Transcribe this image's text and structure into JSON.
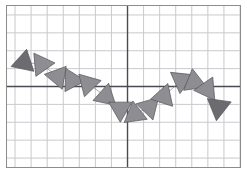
{
  "figure": {
    "title": "",
    "background_color": "#ffffff",
    "frame_border_color": "#8c8c8c",
    "minor_grid_color": "#c9c9cf",
    "major_axis_color": "#4a4a52",
    "marker_fill_light": "#8e8e92",
    "marker_fill_dark": "#6b6b70",
    "marker_stroke": "#5a5a60",
    "connector_color": "#7d7d84"
  },
  "chart_data": {
    "type": "scatter",
    "title": "",
    "xlabel": "",
    "ylabel": "",
    "grid": true,
    "legend": null,
    "xlim": [
      -7.5,
      7.0
    ],
    "ylim": [
      -4.5,
      4.5
    ],
    "x_tick_step": 1,
    "y_tick_step": 1,
    "axis_origin": [
      0,
      0
    ],
    "marker_shape": "triangle",
    "x": [
      -6.45,
      -5.35,
      -4.35,
      -3.45,
      -2.45,
      -1.35,
      -0.45,
      0.45,
      1.35,
      2.25,
      3.35,
      4.15,
      4.95,
      5.65
    ],
    "y": [
      1.35,
      1.25,
      0.55,
      0.35,
      0.15,
      -0.55,
      -1.25,
      -1.55,
      -1.15,
      -0.55,
      0.35,
      0.25,
      -0.15,
      -1.15
    ],
    "rotation_deg": [
      12,
      205,
      160,
      212,
      196,
      252,
      300,
      352,
      44,
      18,
      66,
      112,
      145,
      188
    ],
    "marker_size": [
      30,
      30,
      30,
      30,
      30,
      30,
      30,
      30,
      30,
      30,
      30,
      30,
      30,
      32
    ],
    "shade": [
      "dark",
      "light",
      "light",
      "light",
      "light",
      "light",
      "light",
      "light",
      "light",
      "light",
      "light",
      "light",
      "light",
      "dark"
    ],
    "points": [
      {
        "index": 1,
        "x": -6.45,
        "y": 1.35,
        "rotation_deg": 12,
        "shade": "dark"
      },
      {
        "index": 2,
        "x": -5.35,
        "y": 1.25,
        "rotation_deg": 205,
        "shade": "light"
      },
      {
        "index": 3,
        "x": -4.35,
        "y": 0.55,
        "rotation_deg": 160,
        "shade": "light"
      },
      {
        "index": 4,
        "x": -3.45,
        "y": 0.35,
        "rotation_deg": 212,
        "shade": "light"
      },
      {
        "index": 5,
        "x": -2.45,
        "y": 0.15,
        "rotation_deg": 196,
        "shade": "light"
      },
      {
        "index": 6,
        "x": -1.35,
        "y": -0.55,
        "rotation_deg": 252,
        "shade": "light"
      },
      {
        "index": 7,
        "x": -0.45,
        "y": -1.25,
        "rotation_deg": 300,
        "shade": "light"
      },
      {
        "index": 8,
        "x": 0.45,
        "y": -1.55,
        "rotation_deg": 352,
        "shade": "light"
      },
      {
        "index": 9,
        "x": 1.35,
        "y": -1.15,
        "rotation_deg": 44,
        "shade": "light"
      },
      {
        "index": 10,
        "x": 2.25,
        "y": -0.55,
        "rotation_deg": 18,
        "shade": "light"
      },
      {
        "index": 11,
        "x": 3.35,
        "y": 0.35,
        "rotation_deg": 66,
        "shade": "light"
      },
      {
        "index": 12,
        "x": 4.15,
        "y": 0.25,
        "rotation_deg": 112,
        "shade": "light"
      },
      {
        "index": 13,
        "x": 4.95,
        "y": -0.15,
        "rotation_deg": 145,
        "shade": "light"
      },
      {
        "index": 14,
        "x": 5.65,
        "y": -1.15,
        "rotation_deg": 188,
        "shade": "dark"
      }
    ]
  }
}
